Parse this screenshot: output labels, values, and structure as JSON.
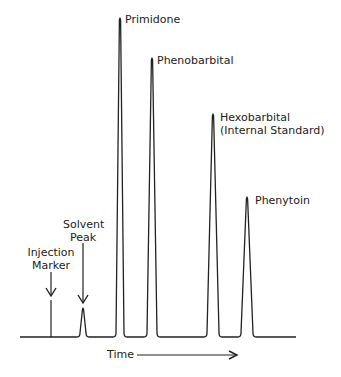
{
  "chart_data": {
    "type": "line",
    "title": "",
    "xlabel": "Time",
    "ylabel": "",
    "grid": false,
    "legend": "none",
    "baseline_y_px": 337,
    "x_range_px": [
      20,
      296
    ],
    "peaks": [
      {
        "name": "Injection Marker",
        "kind": "marker",
        "x_px": 51,
        "top_px": 300,
        "relative_height": 0.12
      },
      {
        "name": "Solvent Peak",
        "kind": "peak",
        "x_px": 83,
        "top_px": 308,
        "half_width_px": 3,
        "relative_height": 0.09
      },
      {
        "name": "Primidone",
        "kind": "peak",
        "x_px": 120,
        "top_px": 18,
        "half_width_px": 4,
        "relative_height": 1.0
      },
      {
        "name": "Phenobarbital",
        "kind": "peak",
        "x_px": 152,
        "top_px": 58,
        "half_width_px": 5,
        "relative_height": 0.87
      },
      {
        "name": "Hexobarbital (Internal Standard)",
        "kind": "peak",
        "x_px": 213,
        "top_px": 114,
        "half_width_px": 6,
        "relative_height": 0.7
      },
      {
        "name": "Phenytoin",
        "kind": "peak",
        "x_px": 247,
        "top_px": 197,
        "half_width_px": 6,
        "relative_height": 0.44
      }
    ],
    "annotations": [
      "Injection Marker",
      "Solvent Peak",
      "Primidone",
      "Phenobarbital",
      "Hexobarbital",
      "(Internal Standard)",
      "Phenytoin",
      "Time"
    ]
  },
  "labels": {
    "primidone": "Primidone",
    "phenobarbital": "Phenobarbital",
    "hexobarbital_line1": "Hexobarbital",
    "hexobarbital_line2": "(Internal Standard)",
    "phenytoin": "Phenytoin",
    "solvent_line1": "Solvent",
    "solvent_line2": "Peak",
    "injection_line1": "Injection",
    "injection_line2": "Marker",
    "time": "Time"
  },
  "colors": {
    "trace": "#222222",
    "text": "#222222"
  }
}
